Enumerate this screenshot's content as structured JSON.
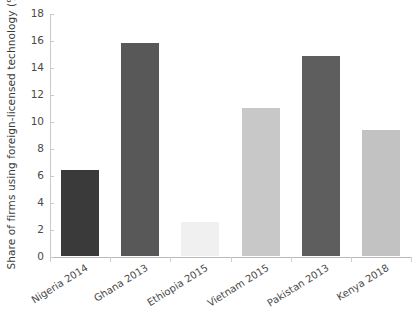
{
  "chart_data": {
    "type": "bar",
    "title": "",
    "xlabel": "",
    "ylabel": "Share of firms using foreign-licensed technology (%)",
    "categories": [
      "Nigeria 2014",
      "Ghana 2013",
      "Ethiopia 2015",
      "Vietnam 2015",
      "Pakistan 2013",
      "Kenya 2018"
    ],
    "values": [
      6.4,
      15.8,
      2.5,
      11.0,
      14.8,
      9.3
    ],
    "bar_colors": [
      "#3a3a3a",
      "#585858",
      "#f0f0f0",
      "#c8c8c8",
      "#5e5e5e",
      "#c2c2c2"
    ],
    "ylim": [
      0,
      18
    ],
    "ytick_values": [
      0,
      2,
      4,
      6,
      8,
      10,
      12,
      14,
      16,
      18
    ],
    "ytick_labels": [
      "0",
      "2",
      "4",
      "6",
      "8",
      "10",
      "12",
      "14",
      "16",
      "18"
    ],
    "grid": false,
    "legend": "none"
  }
}
